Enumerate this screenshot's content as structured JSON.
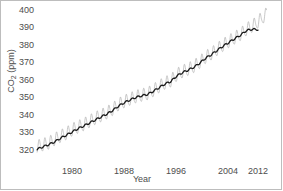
{
  "figure": {
    "frame_color": "#bdbdbd",
    "background": "#ffffff"
  },
  "axis": {
    "ylabel_text": "CO",
    "ylabel_sub": "2",
    "ylabel_unit": " (ppm)",
    "xlabel": "Year",
    "yticks": [
      "400",
      "390",
      "380",
      "370",
      "360",
      "350",
      "340",
      "330",
      "320"
    ],
    "xticks": [
      "1980",
      "1988",
      "1996",
      "2004",
      "2012"
    ]
  },
  "chart_data": {
    "type": "line",
    "title": "",
    "xlabel": "Year",
    "ylabel": "CO2 (ppm)",
    "xlim": [
      1974,
      2013.5
    ],
    "ylim": [
      320,
      400
    ],
    "grid": false,
    "legend": null,
    "yticks": [
      320,
      330,
      340,
      350,
      360,
      370,
      380,
      390,
      400
    ],
    "xticks": [
      1980,
      1988,
      1996,
      2004,
      2012
    ],
    "series": [
      {
        "name": "Monthly mean CO2 (seasonal cycle)",
        "color": "#b0b0b0",
        "linewidth": 0.7,
        "description": "Monthly atmospheric CO2 at Mauna Loa showing a sawtooth seasonal oscillation of roughly 6 ppm peak-to-trough superimposed on a rising trend; peaks in May, troughs in September.",
        "seasonal_amplitude_ppm": 3.1,
        "x": [
          1974.0,
          1975.0,
          1976.0,
          1977.0,
          1978.0,
          1979.0,
          1980.0,
          1981.0,
          1982.0,
          1983.0,
          1984.0,
          1985.0,
          1986.0,
          1987.0,
          1988.0,
          1989.0,
          1990.0,
          1991.0,
          1992.0,
          1993.0,
          1994.0,
          1995.0,
          1996.0,
          1997.0,
          1998.0,
          1999.0,
          2000.0,
          2001.0,
          2002.0,
          2003.0,
          2004.0,
          2005.0,
          2006.0,
          2007.0,
          2008.0,
          2009.0,
          2010.0,
          2011.0,
          2012.0,
          2013.0
        ],
        "annual_mean": [
          330.2,
          331.1,
          332.0,
          333.8,
          335.4,
          336.8,
          338.7,
          340.1,
          341.4,
          343.0,
          344.6,
          346.0,
          347.4,
          349.2,
          351.6,
          353.1,
          354.4,
          355.6,
          356.4,
          357.1,
          358.8,
          360.8,
          362.6,
          363.7,
          366.7,
          368.4,
          369.6,
          371.1,
          373.2,
          375.8,
          377.5,
          379.8,
          381.9,
          383.8,
          385.6,
          387.4,
          389.9,
          391.6,
          393.8,
          396.5
        ]
      },
      {
        "name": "Smoothed annual trend",
        "color": "#1a1a1a",
        "linewidth": 1.3,
        "description": "Deseasonalized trend line rising from about 329 ppm in 1974 to about 390 ppm in 2012.",
        "x": [
          1974.0,
          1975.0,
          1976.0,
          1977.0,
          1978.0,
          1979.0,
          1980.0,
          1981.0,
          1982.0,
          1983.0,
          1984.0,
          1985.0,
          1986.0,
          1987.0,
          1988.0,
          1989.0,
          1990.0,
          1991.0,
          1992.0,
          1993.0,
          1994.0,
          1995.0,
          1996.0,
          1997.0,
          1998.0,
          1999.0,
          2000.0,
          2001.0,
          2002.0,
          2003.0,
          2004.0,
          2005.0,
          2006.0,
          2007.0,
          2008.0,
          2009.0,
          2010.0,
          2011.0,
          2012.0
        ],
        "y": [
          329.0,
          330.3,
          331.4,
          332.8,
          334.6,
          336.2,
          337.8,
          339.5,
          340.9,
          342.4,
          344.0,
          345.5,
          347.0,
          348.8,
          351.0,
          352.8,
          354.2,
          355.5,
          356.3,
          357.0,
          358.6,
          360.5,
          362.3,
          363.6,
          366.3,
          368.1,
          369.4,
          370.9,
          373.0,
          375.5,
          377.3,
          379.5,
          381.6,
          383.5,
          385.4,
          387.2,
          389.5,
          390.2,
          390.0
        ]
      }
    ]
  }
}
